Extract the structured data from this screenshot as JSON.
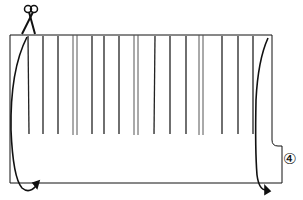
{
  "diagram": {
    "type": "fabric-cutting-instruction",
    "step_label": "④",
    "elements": {
      "scissors": "scissors-icon",
      "fabric_panel": "rectangular fabric with slits",
      "groups": 4,
      "slits_per_group": [
        4,
        4,
        5,
        4
      ],
      "arrows": [
        "left-fold-arrow",
        "right-fold-arrow"
      ]
    },
    "colors": {
      "line": "#111111",
      "background": "#ffffff"
    }
  }
}
